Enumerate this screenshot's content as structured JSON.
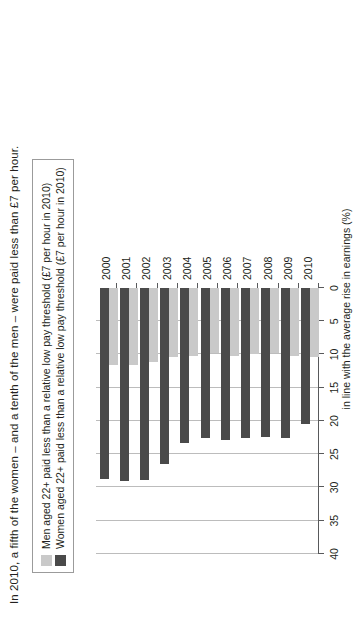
{
  "title": "In 2010, a fifth of the women – and a tenth of the men – were paid less than £7 per hour.",
  "legend": {
    "items": [
      {
        "key": "men",
        "label": "Men aged 22+ paid less than a relative low pay threshold (£7 per hour in 2010)",
        "color": "#c9c9c9"
      },
      {
        "key": "women",
        "label": "Women aged 22+ paid less than a relative low pay threshold (£7 per hour in 2010)",
        "color": "#4a4a4a"
      }
    ]
  },
  "axis": {
    "value_label": "in line with the average rise in earnings (%)",
    "ticks": [
      "0",
      "5",
      "10",
      "15",
      "20",
      "25",
      "30",
      "35",
      "40"
    ]
  },
  "chart_data": {
    "type": "bar",
    "title": "In 2010, a fifth of the women – and a tenth of the men – were paid less than £7 per hour.",
    "orientation": "horizontal",
    "categories": [
      "2000",
      "2001",
      "2002",
      "2003",
      "2004",
      "2005",
      "2006",
      "2007",
      "2008",
      "2009",
      "2010"
    ],
    "series": [
      {
        "name": "Men aged 22+ paid less than a relative low pay threshold (£7 per hour in 2010)",
        "color": "#c9c9c9",
        "values": [
          11.6,
          11.6,
          11.2,
          10.4,
          10.2,
          9.8,
          10.2,
          10.0,
          9.8,
          10.2,
          10.4
        ]
      },
      {
        "name": "Women aged 22+ paid less than a relative low pay threshold (£7 per hour in 2010)",
        "color": "#4a4a4a",
        "values": [
          28.7,
          29.0,
          28.8,
          26.5,
          23.3,
          22.6,
          22.8,
          22.6,
          22.4,
          22.6,
          20.4
        ]
      }
    ],
    "xlabel": "in line with the average rise in earnings (%)",
    "ylabel": "",
    "xlim": [
      0,
      40
    ],
    "xticks": [
      0,
      5,
      10,
      15,
      20,
      25,
      30,
      35,
      40
    ],
    "grid": true,
    "legend_position": "top-left"
  }
}
